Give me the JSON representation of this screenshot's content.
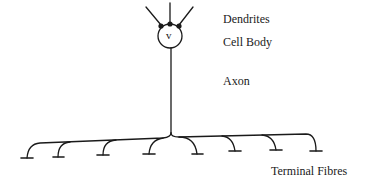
{
  "diagram": {
    "cell_body_symbol": "v",
    "labels": {
      "dendrites": "Dendrites",
      "cell_body": "Cell Body",
      "axon": "Axon",
      "terminal_fibres": "Terminal Fibres"
    },
    "terminal_count": 8,
    "stroke_color": "#1a1a1a"
  }
}
